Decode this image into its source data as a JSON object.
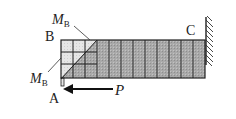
{
  "diagram": {
    "type": "cantilever beam with moment and force",
    "labels": {
      "moment_top": {
        "main": "M",
        "sub": "B"
      },
      "point_b": "B",
      "moment_bottom": {
        "main": "M",
        "sub": "B"
      },
      "point_a": "A",
      "force": "P",
      "point_c": "C"
    },
    "colors": {
      "stroke": "#222222",
      "grid_fill": "#e4e4e4",
      "beam_fill": "#a8a8a8",
      "background": "#ffffff"
    }
  }
}
